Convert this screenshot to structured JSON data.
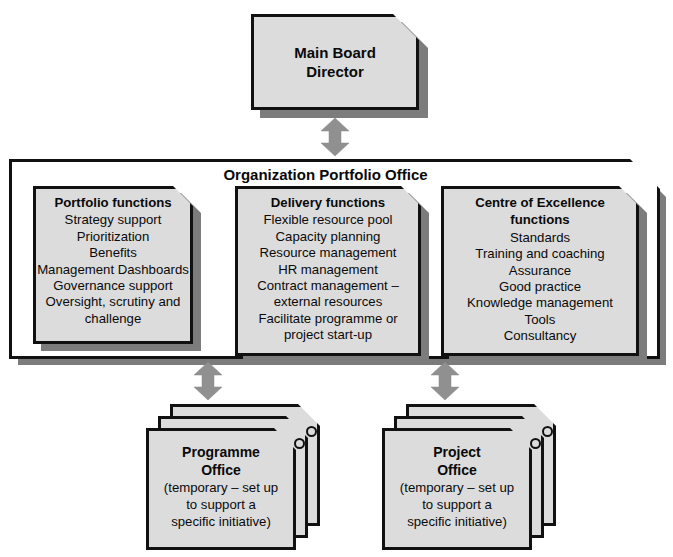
{
  "diagram": {
    "colors": {
      "box_fill": "#dcdcdc",
      "panel_fill": "#ffffff",
      "outline": "#111111",
      "shadow": "#7c7c7c",
      "arrow": "#909090",
      "background": "#ffffff"
    }
  },
  "top_node": {
    "label_line1": "Main Board",
    "label_line2": "Director"
  },
  "arrows": {
    "top_connector_name": "double-headed-arrow",
    "left_connector_name": "double-headed-arrow",
    "right_connector_name": "double-headed-arrow"
  },
  "portfolio_office": {
    "title": "Organization Portfolio Office",
    "columns": [
      {
        "id": "portfolio-functions",
        "heading": [
          "Portfolio functions"
        ],
        "items": [
          "Strategy support",
          "Prioritization",
          "Benefits",
          "Management Dashboards",
          "Governance support",
          "Oversight, scrutiny and",
          "challenge"
        ]
      },
      {
        "id": "delivery-functions",
        "heading": [
          "Delivery functions"
        ],
        "items": [
          "Flexible resource pool",
          "Capacity planning",
          "Resource management",
          "HR management",
          "Contract management –",
          "external resources",
          "Facilitate programme or",
          "project start-up"
        ]
      },
      {
        "id": "centre-of-excellence-functions",
        "heading": [
          "Centre of Excellence",
          "functions"
        ],
        "items": [
          "Standards",
          "Training and coaching",
          "Assurance",
          "Good practice",
          "Knowledge management",
          "Tools",
          "Consultancy"
        ]
      }
    ]
  },
  "bottom_nodes": [
    {
      "id": "programme-office",
      "title_line1": "Programme",
      "title_line2": "Office",
      "detail": [
        "(temporary – set up",
        "to support a",
        "specific initiative)"
      ],
      "stack_count": 3
    },
    {
      "id": "project-office",
      "title_line1": "Project",
      "title_line2": "Office",
      "detail": [
        "(temporary – set up",
        "to support a",
        "specific initiative)"
      ],
      "stack_count": 3
    }
  ],
  "caption": {
    "number": "",
    "text": ""
  }
}
